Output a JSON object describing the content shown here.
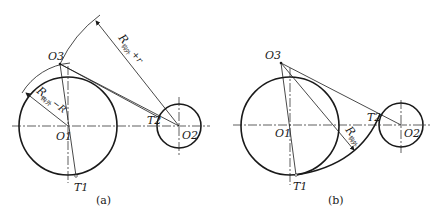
{
  "figure_a": {
    "caption": "(a)",
    "labels": {
      "o1": "O1",
      "o2": "O2",
      "o3": "O3",
      "t1": "T1",
      "t2": "T2",
      "dim_outer": "R",
      "dim_outer_sub": "钩外",
      "dim_outer_suffix": "+r",
      "dim_inner": "R",
      "dim_inner_sub": "钩外",
      "dim_inner_suffix": "−R"
    }
  },
  "figure_b": {
    "caption": "(b)",
    "labels": {
      "o1": "O1",
      "o2": "O2",
      "o3": "O3",
      "t1": "T1",
      "t2": "T2",
      "dim": "R",
      "dim_sub": "钩外"
    }
  },
  "colors": {
    "ink": "#1a1a1a",
    "background": "#ffffff"
  }
}
